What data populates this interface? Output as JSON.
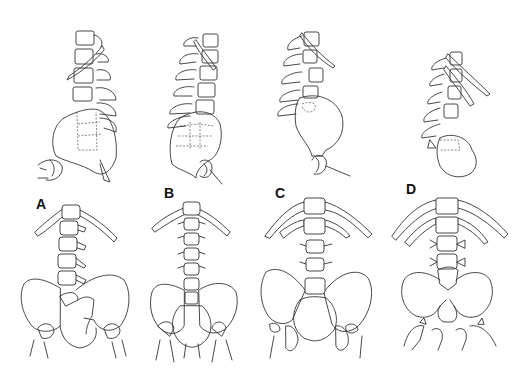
{
  "figure": {
    "panels": [
      {
        "id": "A",
        "label": "A",
        "label_pos": [
          36,
          196
        ],
        "views": [
          "lateral",
          "frontal"
        ]
      },
      {
        "id": "B",
        "label": "B",
        "label_pos": [
          164,
          185
        ],
        "views": [
          "lateral",
          "frontal"
        ]
      },
      {
        "id": "C",
        "label": "C",
        "label_pos": [
          275,
          185
        ],
        "views": [
          "lateral",
          "frontal"
        ]
      },
      {
        "id": "D",
        "label": "D",
        "label_pos": [
          406,
          181
        ],
        "views": [
          "lateral",
          "frontal"
        ]
      }
    ],
    "colors": {
      "line": "#333333",
      "background": "#ffffff"
    }
  }
}
